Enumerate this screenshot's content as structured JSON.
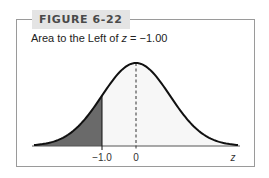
{
  "figure": {
    "label": "FIGURE 6-22",
    "title_prefix": "Area to the Left of ",
    "title_var": "z",
    "title_suffix": " = −1.00"
  },
  "colors": {
    "shade": "#6a6a6a",
    "curve": "#111111",
    "frame": "#9a9a9a",
    "label_bg": "#e4e4e4",
    "unshaded_fill": "#f7f7f7"
  },
  "chart_data": {
    "type": "area",
    "title": "Area to the Left of z = −1.00",
    "xlabel": "z",
    "ylabel": "",
    "distribution": "standard normal",
    "xlim": [
      -3.0,
      3.0
    ],
    "shaded_region": {
      "from": "-inf",
      "to": -1.0,
      "area": 0.1587
    },
    "dashed_line_at": 0,
    "ticks": [
      {
        "value": -1.0,
        "label": "−1.0"
      },
      {
        "value": 0,
        "label": "0"
      }
    ],
    "axis_label": "z",
    "grid": false,
    "legend": null
  }
}
